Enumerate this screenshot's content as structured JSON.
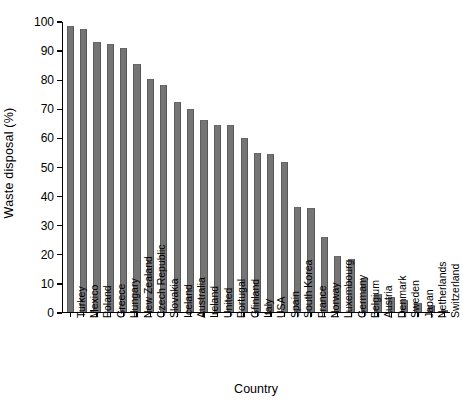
{
  "chart_data": {
    "type": "bar",
    "title": "",
    "xlabel": "Country",
    "ylabel": "Waste disposal (%)",
    "ylim": [
      0,
      100
    ],
    "yticks": [
      0,
      10,
      20,
      30,
      40,
      50,
      60,
      70,
      80,
      90,
      100
    ],
    "grid": false,
    "legend": null,
    "bar_color": "#757575",
    "categories": [
      "Turkey",
      "Mexico",
      "Poland",
      "Greece",
      "Hungary",
      "New Zealand",
      "Czech Republic",
      "Slovakia",
      "Iceland",
      "Australia",
      "Ireland",
      "United",
      "Portugal",
      "Gfinland",
      "Italy",
      "USA",
      "Spain",
      "South Korea",
      "France",
      "Norway",
      "Luxembourg",
      "Germany",
      "Belgium",
      "Austria",
      "Denmark",
      "Sweden",
      "Japan",
      "Netherlands",
      "Switzerland"
    ],
    "values": [
      98,
      97,
      92.5,
      92,
      90.5,
      85,
      80,
      78,
      72,
      69.5,
      66,
      64,
      64,
      59.5,
      54.5,
      54,
      51.5,
      36,
      35.5,
      25.5,
      19,
      18,
      11.5,
      6,
      5,
      4,
      3,
      2,
      0.6
    ]
  }
}
